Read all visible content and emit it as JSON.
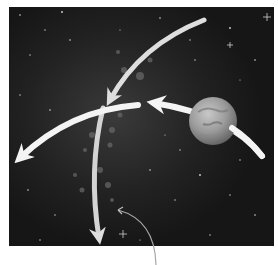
{
  "figure": {
    "type": "astronomy-illustration",
    "background": {
      "description": "starfield",
      "color": "#1c1c1c",
      "frame": {
        "x": 9,
        "y": 7,
        "width": 265,
        "height": 239
      }
    },
    "planet": {
      "cx": 213,
      "cy": 121,
      "r": 24,
      "color": "#9a9a9a"
    },
    "arrows": [
      {
        "id": "incoming-from-top-right",
        "path": "M 204 20 Q 140 45 108 106",
        "head": "down-left",
        "color": "#e2e2e2"
      },
      {
        "id": "deflected-left",
        "path": "M 138 105 Q 70 110 16 160",
        "head": "left-down",
        "color": "#f4f4f4"
      },
      {
        "id": "planet-orbit-path",
        "path": "M 262 156 Q 230 115 150 103",
        "head": "left",
        "color": "#f4f4f4"
      },
      {
        "id": "downward-path",
        "path": "M 103 108 Q 88 170 100 243",
        "head": "down",
        "color": "#d8d8d8"
      }
    ],
    "callout": {
      "leader_line": "M 156 265 Q 155 220 117 210",
      "label": ""
    },
    "text_labels": []
  }
}
